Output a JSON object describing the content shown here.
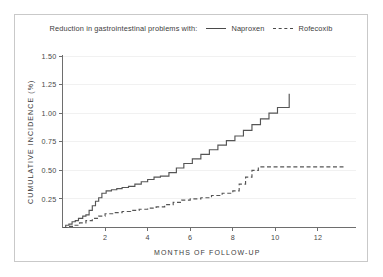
{
  "legend": {
    "prefix": "Reduction in gastrointestinal problems with:",
    "entries": [
      {
        "label": "Naproxen",
        "style": "solid",
        "color": "#555555"
      },
      {
        "label": "Rofecoxib",
        "style": "dashed",
        "color": "#555555"
      }
    ]
  },
  "colors": {
    "background": "#ffffff",
    "frame": "#c9c9c9",
    "axis": "#6e6e6e",
    "grid": "#f1f1f1",
    "series": "#555555",
    "text": "#3d3d3d"
  },
  "chart_data": {
    "type": "line",
    "subtype": "step",
    "title": "",
    "subtitle": "",
    "annotation": "Reduction in gastrointestinal problems with:",
    "xlabel": "MONTHS OF FOLLOW-UP",
    "ylabel": "CUMULATIVE INCIDENCE (%)",
    "xlim": [
      0,
      13.6
    ],
    "ylim": [
      0,
      1.5
    ],
    "xticks": [
      2,
      4,
      6,
      8,
      10,
      12
    ],
    "xtick_labels": [
      "2",
      "4",
      "6",
      "8",
      "10",
      "12"
    ],
    "yticks": [
      0.25,
      0.5,
      0.75,
      1.0,
      1.25,
      1.5
    ],
    "ytick_labels": [
      "0.25",
      "0.50",
      "0.75",
      "1.00",
      "1.25",
      "1.50"
    ],
    "grid": "horizontal-faint",
    "legend_position": "top-center",
    "series": [
      {
        "name": "Naproxen",
        "style": "solid",
        "color": "#555555",
        "x": [
          0.05,
          0.15,
          0.3,
          0.45,
          0.6,
          0.75,
          0.95,
          1.1,
          1.25,
          1.4,
          1.55,
          1.7,
          1.85,
          2.05,
          2.3,
          2.55,
          2.8,
          3.1,
          3.4,
          3.7,
          4.0,
          4.3,
          4.6,
          5.0,
          5.35,
          5.7,
          6.1,
          6.5,
          6.9,
          7.3,
          7.7,
          8.1,
          8.5,
          8.9,
          9.3,
          9.7,
          10.1,
          10.6,
          10.65
        ],
        "y": [
          0.0,
          0.02,
          0.03,
          0.05,
          0.06,
          0.08,
          0.1,
          0.11,
          0.15,
          0.19,
          0.23,
          0.26,
          0.3,
          0.32,
          0.33,
          0.34,
          0.35,
          0.36,
          0.38,
          0.4,
          0.42,
          0.44,
          0.45,
          0.48,
          0.52,
          0.56,
          0.6,
          0.64,
          0.68,
          0.72,
          0.76,
          0.8,
          0.85,
          0.9,
          0.95,
          1.0,
          1.05,
          1.05,
          1.17
        ]
      },
      {
        "name": "Rofecoxib",
        "style": "dashed",
        "color": "#555555",
        "x": [
          0.05,
          0.25,
          0.5,
          0.8,
          1.1,
          1.4,
          1.7,
          2.0,
          2.4,
          2.8,
          3.2,
          3.6,
          4.0,
          4.4,
          4.8,
          5.2,
          5.6,
          6.0,
          6.5,
          7.0,
          7.5,
          8.0,
          8.3,
          8.6,
          8.9,
          9.2,
          13.2
        ],
        "y": [
          0.0,
          0.01,
          0.02,
          0.04,
          0.06,
          0.08,
          0.1,
          0.12,
          0.13,
          0.14,
          0.15,
          0.16,
          0.17,
          0.18,
          0.2,
          0.22,
          0.24,
          0.25,
          0.26,
          0.28,
          0.3,
          0.32,
          0.38,
          0.44,
          0.5,
          0.53,
          0.53
        ]
      }
    ]
  }
}
